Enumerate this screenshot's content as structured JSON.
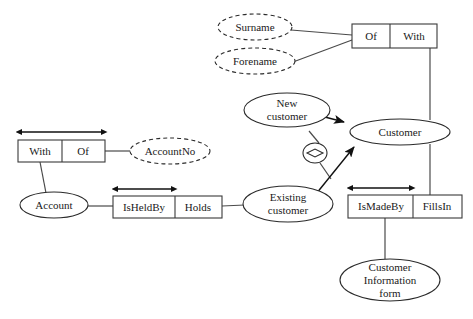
{
  "diagram": {
    "background_color": "#ffffff",
    "line_color": "#2a2a2a",
    "text_color": "#1a1a1a",
    "entities": [
      {
        "id": "account",
        "label": "Account",
        "kind": "entity-type"
      },
      {
        "id": "customer",
        "label": "Customer",
        "kind": "entity-type"
      },
      {
        "id": "new_customer",
        "label_line1": "New",
        "label_line2": "customer",
        "kind": "subtype"
      },
      {
        "id": "existing_customer",
        "label_line1": "Existing",
        "label_line2": "customer",
        "kind": "subtype"
      },
      {
        "id": "cust_info_form",
        "label_line1": "Customer",
        "label_line2": "Information",
        "label_line3": "form",
        "kind": "entity-type"
      }
    ],
    "value_types": [
      {
        "id": "account_no",
        "label": "AccountNo",
        "kind": "value-type"
      },
      {
        "id": "surname",
        "label": "Surname",
        "kind": "value-type"
      },
      {
        "id": "forename",
        "label": "Forename",
        "kind": "value-type"
      }
    ],
    "fact_types": [
      {
        "id": "account_has_accountno",
        "roles": [
          "With",
          "Of"
        ],
        "uniqueness": "spans-both-roles"
      },
      {
        "id": "name_of_customer",
        "roles": [
          "Of",
          "With"
        ],
        "uniqueness": "none-shown"
      },
      {
        "id": "account_held_by_customer",
        "roles": [
          "IsHeldBy",
          "Holds"
        ],
        "uniqueness": "first-role"
      },
      {
        "id": "form_made_by_customer",
        "roles": [
          "IsMadeBy",
          "FillsIn"
        ],
        "uniqueness": "first-role"
      }
    ],
    "constraints": [
      {
        "id": "exclusion",
        "symbol": "exclusion-diamond",
        "glyph": "diamond"
      }
    ],
    "subtype_links": [
      {
        "from": "New customer",
        "to": "Customer"
      },
      {
        "from": "Existing customer",
        "to": "Customer"
      }
    ]
  }
}
